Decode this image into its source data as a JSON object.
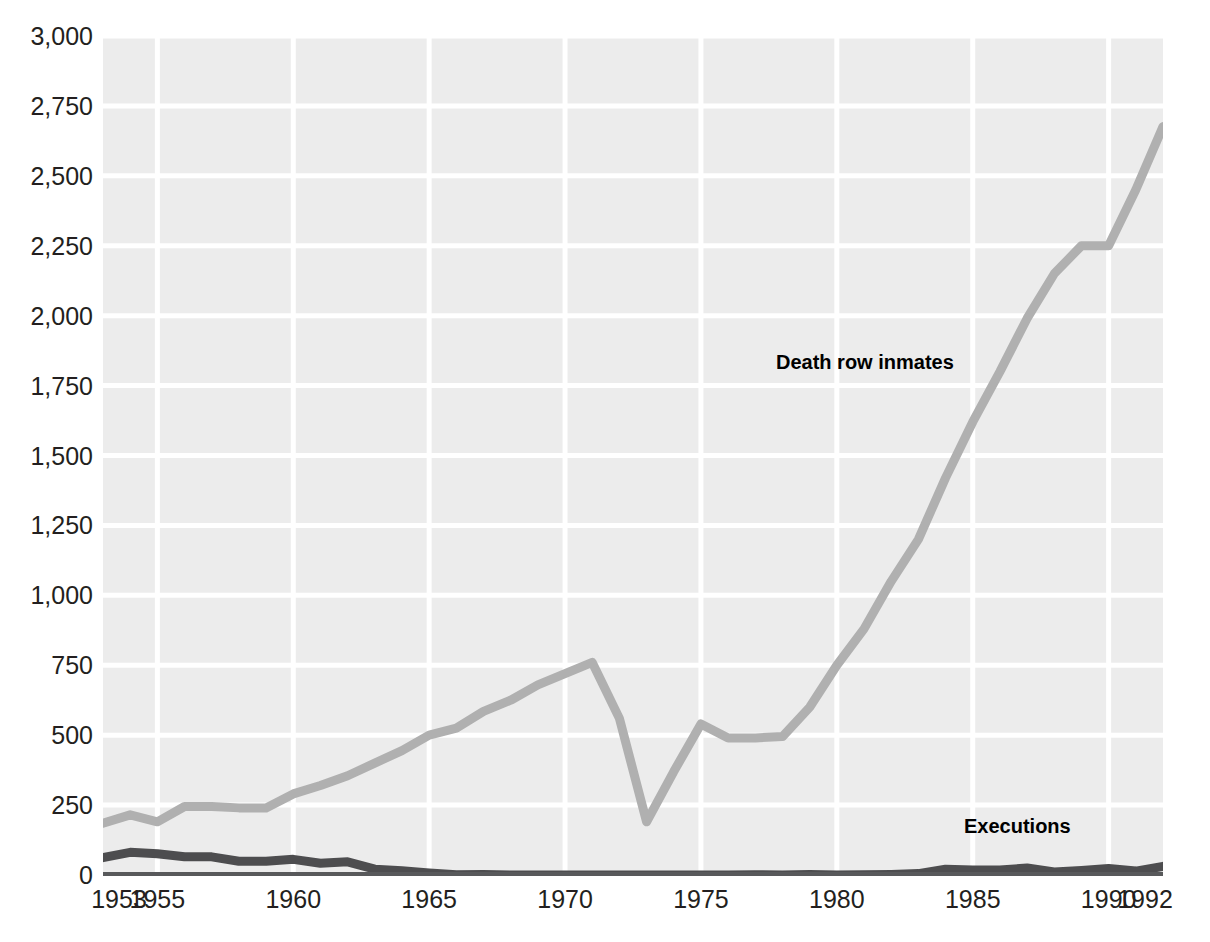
{
  "chart_data": {
    "type": "line",
    "title": "",
    "subtitle": "",
    "xlabel": "",
    "ylabel": "",
    "xlim": [
      1953,
      1992
    ],
    "ylim": [
      0,
      3000
    ],
    "grid": true,
    "grid_color": "#ffffff",
    "plot_background": "#ececec",
    "legend_position": "inline-annotation",
    "y_ticks": [
      0,
      250,
      500,
      750,
      1000,
      1250,
      1500,
      1750,
      2000,
      2250,
      2500,
      2750,
      3000
    ],
    "y_tick_labels": [
      "0",
      "250",
      "500",
      "750",
      "1,000",
      "1,250",
      "1,500",
      "1,750",
      "2,000",
      "2,250",
      "2,500",
      "2,750",
      "3,000"
    ],
    "x_ticks": [
      1953,
      1955,
      1960,
      1965,
      1970,
      1975,
      1980,
      1985,
      1990,
      1992
    ],
    "x_tick_labels": [
      "1953",
      "1955",
      "1960",
      "1965",
      "1970",
      "1975",
      "1980",
      "1985",
      "1990",
      "1992"
    ],
    "x": [
      1953,
      1954,
      1955,
      1956,
      1957,
      1958,
      1959,
      1960,
      1961,
      1962,
      1963,
      1964,
      1965,
      1966,
      1967,
      1968,
      1969,
      1970,
      1971,
      1972,
      1973,
      1974,
      1975,
      1976,
      1977,
      1978,
      1979,
      1980,
      1981,
      1982,
      1983,
      1984,
      1985,
      1986,
      1987,
      1988,
      1989,
      1990,
      1991,
      1992
    ],
    "series": [
      {
        "name": "Death row inmates",
        "color": "#b0b0b0",
        "line_width": 9,
        "values": [
          185,
          215,
          190,
          245,
          245,
          240,
          240,
          290,
          320,
          355,
          400,
          445,
          500,
          525,
          585,
          625,
          680,
          720,
          760,
          560,
          190,
          370,
          540,
          490,
          490,
          495,
          600,
          750,
          880,
          1050,
          1200,
          1420,
          1620,
          1800,
          1990,
          2150,
          2250,
          2250,
          2450,
          2676
        ]
      },
      {
        "name": "Executions",
        "color": "#4d4d4f",
        "line_width": 9,
        "values": [
          62,
          81,
          76,
          65,
          65,
          49,
          49,
          56,
          42,
          47,
          21,
          15,
          7,
          1,
          2,
          0,
          0,
          0,
          0,
          0,
          0,
          0,
          0,
          0,
          1,
          0,
          2,
          0,
          1,
          2,
          5,
          21,
          18,
          18,
          25,
          11,
          16,
          23,
          14,
          31
        ]
      }
    ],
    "annotations": [
      {
        "text": "Death row inmates",
        "x": 1980,
        "y": 1960
      },
      {
        "text": "Executions",
        "x": 1988,
        "y": 210
      }
    ]
  },
  "axis": {
    "y_labels": [
      "3,000",
      "2,750",
      "2,500",
      "2,250",
      "2,000",
      "1,750",
      "1,500",
      "1,250",
      "1,000",
      "750",
      "500",
      "250",
      "0"
    ],
    "x_labels": [
      "1953",
      "1955",
      "1960",
      "1965",
      "1970",
      "1975",
      "1980",
      "1985",
      "1990",
      "1992"
    ]
  },
  "labels": {
    "death_row": "Death row inmates",
    "executions": "Executions"
  },
  "colors": {
    "death_row_line": "#b0b0b0",
    "executions_line": "#4d4d4f",
    "plot_background": "#ececec",
    "gridline": "#ffffff",
    "text": "#231f20",
    "baseline": "#58595b"
  }
}
